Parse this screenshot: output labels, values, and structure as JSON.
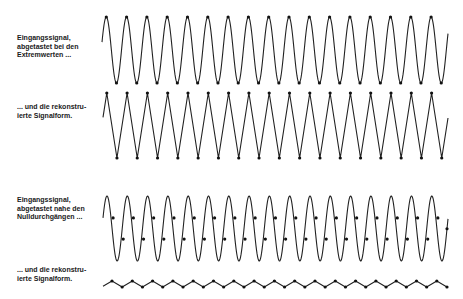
{
  "panels": [
    {
      "id": "extrema-input",
      "label_lines": [
        "Eingangssignal,",
        "abgetastet bei den",
        "Extremwerten ..."
      ],
      "label_top": 34,
      "waveform": {
        "type": "sine",
        "x_start": 102,
        "x_end": 448,
        "center_y": 50,
        "amplitude": 33,
        "period": 20.3,
        "first_peak_x": 106.3
      },
      "samples": {
        "mode": "extrema"
      }
    },
    {
      "id": "extrema-reconstructed",
      "label_lines": [
        "... und die rekonstru-",
        "ierte Signalform."
      ],
      "label_top": 103,
      "waveform": {
        "type": "triangle",
        "x_start": 103,
        "x_end": 448,
        "center_y": 125.5,
        "amplitude": 32.5,
        "period": 20.3,
        "first_peak_x": 106.8
      },
      "samples": {
        "mode": "extrema"
      }
    },
    {
      "id": "zero-crossing-input",
      "label_lines": [
        "Eingangssignal,",
        "abgetastet nahe den",
        "Nulldurchgängen ..."
      ],
      "label_top": 196,
      "waveform": {
        "type": "sine",
        "x_start": 103,
        "x_end": 448,
        "center_y": 228.5,
        "amplitude": 32.5,
        "period": 20.3,
        "first_peak_x": 107
      },
      "samples": {
        "mode": "near-zero",
        "offset": 3.5
      }
    },
    {
      "id": "zero-crossing-reconstructed",
      "label_lines": [
        "... und die rekonstru-",
        "ierte Signalform."
      ],
      "label_top": 266,
      "waveform": {
        "type": "zigzag",
        "x_start": 103,
        "x_end": 448,
        "center_y": 284,
        "amplitude": 3,
        "period": 20.3,
        "first_peak_x": 112
      },
      "samples": {
        "mode": "extrema"
      }
    }
  ],
  "colors": {
    "stroke": "#222222",
    "dot": "#111111",
    "background": "#ffffff"
  }
}
